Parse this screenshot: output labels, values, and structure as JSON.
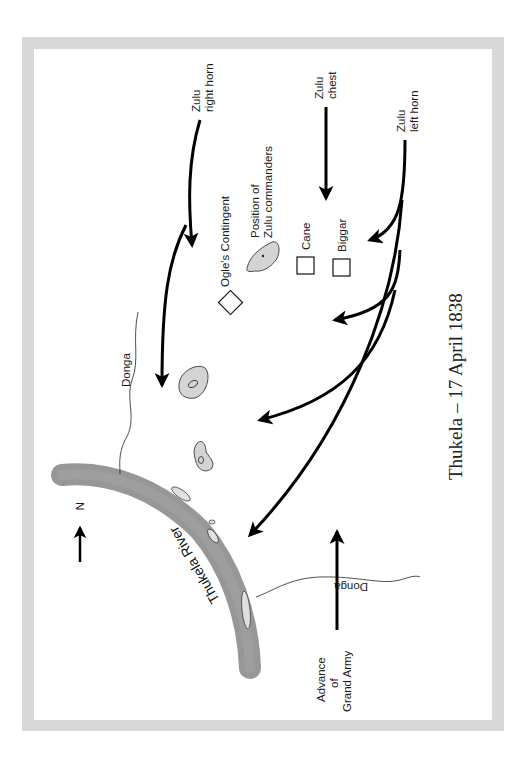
{
  "map": {
    "title": "Thukela – 17 April 1838",
    "north_label": "N",
    "river_label": "Thukela River",
    "labels": {
      "right_horn_line1": "Zulu",
      "right_horn_line2": "right horn",
      "chest_line1": "Zulu",
      "chest_line2": "chest",
      "left_horn_line1": "Zulu",
      "left_horn_line2": "left horn",
      "commanders_line1": "Position of",
      "commanders_line2": "Zulu commanders",
      "ogle": "Ogle's Contingent",
      "cane": "Cane",
      "biggar": "Biggar",
      "donga_top": "Donga",
      "donga_bottom": "Donga",
      "grand_army_line1": "Advance",
      "grand_army_line2": "of",
      "grand_army_line3": "Grand Army"
    },
    "colors": {
      "frame": "#d9d9d9",
      "river": "#8c8c8c",
      "hill": "#d0d0d0",
      "arrow": "#000000"
    }
  }
}
